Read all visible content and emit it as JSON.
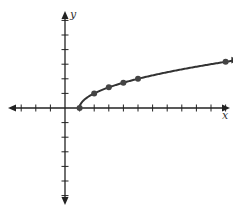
{
  "chart_data": {
    "type": "line",
    "title": "",
    "function": "y = sqrt(x - 1)",
    "xlabel": "x",
    "ylabel": "y",
    "xlim": [
      -4,
      11
    ],
    "ylim": [
      -6,
      6
    ],
    "grid": false,
    "x_ticks": [
      -3,
      -2,
      -1,
      1,
      2,
      3,
      4,
      5,
      6,
      7,
      8,
      9,
      10,
      11
    ],
    "y_ticks": [
      -6,
      -5,
      -4,
      -3,
      -2,
      -1,
      1,
      2,
      3,
      4,
      5,
      6
    ],
    "tick_labels_shown": false,
    "points": [
      {
        "x": 1,
        "y": 0
      },
      {
        "x": 2,
        "y": 1
      },
      {
        "x": 3,
        "y": 1.414
      },
      {
        "x": 4,
        "y": 1.732
      },
      {
        "x": 5,
        "y": 2
      },
      {
        "x": 11,
        "y": 3.162
      }
    ],
    "curve_start": {
      "x": 1,
      "y": 0
    },
    "curve_continues": "right (arrow)",
    "colors": {
      "axis": "#222222",
      "curve": "#333333",
      "points": "#444444"
    }
  },
  "labels": {
    "x_axis": "x",
    "y_axis": "y"
  }
}
